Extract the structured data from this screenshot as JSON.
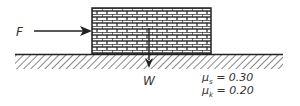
{
  "diagram": {
    "type": "free-body friction diagram",
    "labels": {
      "force": "F",
      "weight": "W"
    },
    "coefficients": {
      "static": {
        "symbol": "μ",
        "subscript": "s",
        "value": "= 0.30"
      },
      "kinetic": {
        "symbol": "μ",
        "subscript": "k",
        "value": "= 0.20"
      }
    },
    "colors": {
      "stroke": "#222222",
      "text": "#333333",
      "background": "#ffffff"
    }
  }
}
